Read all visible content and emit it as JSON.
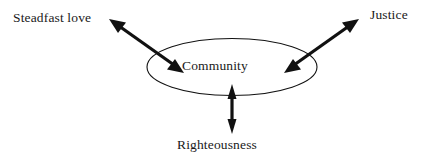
{
  "diagram": {
    "background_color": "#ffffff",
    "stroke_color": "#111111",
    "text_color": "#1a1a1a",
    "center": {
      "shape": "ellipse",
      "label": "Community",
      "cx": 232,
      "cy": 67,
      "rx": 85,
      "ry": 28.5
    },
    "nodes": [
      {
        "id": "steadfast-love",
        "label": "Steadfast love",
        "position": "top-left",
        "x": 13,
        "y": 11
      },
      {
        "id": "justice",
        "label": "Justice",
        "position": "top-right",
        "x": 370,
        "y": 8
      },
      {
        "id": "righteousness",
        "label": "Righteousness",
        "position": "bottom-center",
        "x": 177,
        "y": 138
      }
    ],
    "connectors": [
      {
        "id": "steadfast-love-connector",
        "from": "steadfast-love",
        "to": "community",
        "style": "double-headed-arrow",
        "direction": "diagonal-down-right",
        "x1": 110,
        "y1": 20,
        "x2": 183,
        "y2": 72
      },
      {
        "id": "justice-connector",
        "from": "justice",
        "to": "community",
        "style": "double-headed-arrow",
        "direction": "diagonal-down-left",
        "x1": 358,
        "y1": 20,
        "x2": 285,
        "y2": 72
      },
      {
        "id": "righteousness-connector",
        "from": "righteousness",
        "to": "community",
        "style": "double-headed-arrow",
        "direction": "vertical",
        "x1": 232,
        "y1": 85,
        "x2": 232,
        "y2": 133
      }
    ]
  }
}
